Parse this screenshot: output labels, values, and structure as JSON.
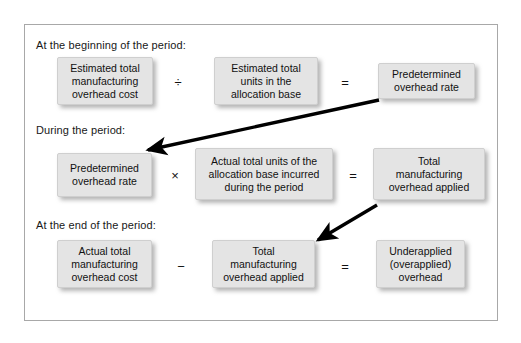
{
  "figure": {
    "title_visible": false,
    "frame": {
      "border_color": "#a8a8a8",
      "background": "#ffffff"
    },
    "box_style": {
      "fill": "#e4e4e4",
      "border": "#cfcfcf",
      "text": "#111111",
      "shadow": "rgba(120,120,120,0.55)"
    }
  },
  "sections": [
    {
      "id": "beginning",
      "label": "At the beginning of the period:"
    },
    {
      "id": "during",
      "label": "During the period:"
    },
    {
      "id": "end",
      "label": "At the end of the period:"
    }
  ],
  "rows": [
    {
      "id": "row-beginning",
      "boxes": [
        {
          "id": "estimated-total-manufacturing-overhead-cost",
          "text": "Estimated total\nmanufacturing\noverhead cost"
        },
        {
          "id": "estimated-total-units-in-the-allocation-base",
          "text": "Estimated total\nunits in the\nallocation base"
        },
        {
          "id": "predetermined-overhead-rate-result",
          "text": "Predetermined\noverhead rate"
        }
      ],
      "operators": [
        {
          "id": "divide",
          "symbol": "÷",
          "name": "division-operator"
        },
        {
          "id": "equals",
          "symbol": "=",
          "name": "equals-operator"
        }
      ]
    },
    {
      "id": "row-during",
      "boxes": [
        {
          "id": "predetermined-overhead-rate-input",
          "text": "Predetermined\noverhead rate"
        },
        {
          "id": "actual-total-units-of-the-allocation-base-incurred-during-the-period",
          "text": "Actual total units of the\nallocation base incurred\nduring the period"
        },
        {
          "id": "total-manufacturing-overhead-applied-result",
          "text": "Total\nmanufacturing\noverhead applied"
        }
      ],
      "operators": [
        {
          "id": "multiply",
          "symbol": "×",
          "name": "multiplication-operator"
        },
        {
          "id": "equals",
          "symbol": "=",
          "name": "equals-operator"
        }
      ]
    },
    {
      "id": "row-end",
      "boxes": [
        {
          "id": "actual-total-manufacturing-overhead-cost",
          "text": "Actual total\nmanufacturing\noverhead cost"
        },
        {
          "id": "total-manufacturing-overhead-applied-input",
          "text": "Total\nmanufacturing\noverhead applied"
        },
        {
          "id": "underapplied-overapplied-overhead",
          "text": "Underapplied\n(overapplied)\noverhead"
        }
      ],
      "operators": [
        {
          "id": "minus",
          "symbol": "−",
          "name": "subtraction-operator"
        },
        {
          "id": "equals",
          "symbol": "=",
          "name": "equals-operator"
        }
      ]
    }
  ],
  "arrows": [
    {
      "id": "arrow-predetermined-rate-carryover",
      "name": "arrow-predetermined-overhead-rate-to-during-period",
      "from": "predetermined-overhead-rate-result",
      "to": "predetermined-overhead-rate-input",
      "color": "#000000"
    },
    {
      "id": "arrow-overhead-applied-carryover",
      "name": "arrow-total-manufacturing-overhead-applied-to-end-period",
      "from": "total-manufacturing-overhead-applied-result",
      "to": "total-manufacturing-overhead-applied-input",
      "color": "#000000"
    }
  ]
}
